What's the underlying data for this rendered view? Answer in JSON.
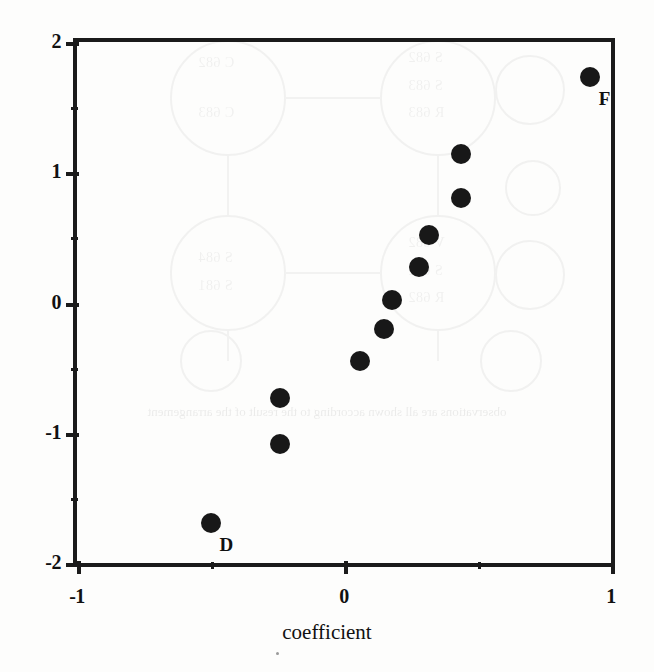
{
  "chart_data": {
    "type": "scatter",
    "title": "",
    "subtitle": "",
    "xlabel": "coefficient",
    "ylabel": "",
    "xlim": [
      -1,
      1
    ],
    "ylim": [
      -2,
      2
    ],
    "grid": false,
    "legend": "none",
    "x_ticks": [
      {
        "value": -1,
        "label": "-1",
        "kind": "major"
      },
      {
        "value": -0.5,
        "label": "",
        "kind": "minor"
      },
      {
        "value": 0,
        "label": "0",
        "kind": "major"
      },
      {
        "value": 0.5,
        "label": "",
        "kind": "minor"
      },
      {
        "value": 1,
        "label": "1",
        "kind": "major"
      }
    ],
    "y_ticks": [
      {
        "value": 2,
        "label": "2",
        "kind": "major"
      },
      {
        "value": 1.5,
        "label": "",
        "kind": "minor"
      },
      {
        "value": 1,
        "label": "1",
        "kind": "major"
      },
      {
        "value": 0.5,
        "label": "",
        "kind": "minor"
      },
      {
        "value": 0,
        "label": "0",
        "kind": "major"
      },
      {
        "value": -0.5,
        "label": "",
        "kind": "minor"
      },
      {
        "value": -1,
        "label": "-1",
        "kind": "major"
      },
      {
        "value": -1.5,
        "label": "",
        "kind": "minor"
      },
      {
        "value": -2,
        "label": "-2",
        "kind": "major"
      }
    ],
    "marker": {
      "shape": "circle",
      "color": "#181818",
      "size_px": 20
    },
    "points": [
      {
        "x": 0.92,
        "y": 1.73,
        "label": "F"
      },
      {
        "x": 0.44,
        "y": 1.14,
        "label": ""
      },
      {
        "x": 0.44,
        "y": 0.8,
        "label": ""
      },
      {
        "x": 0.32,
        "y": 0.52,
        "label": ""
      },
      {
        "x": 0.28,
        "y": 0.27,
        "label": ""
      },
      {
        "x": 0.18,
        "y": 0.02,
        "label": ""
      },
      {
        "x": 0.15,
        "y": -0.2,
        "label": ""
      },
      {
        "x": 0.06,
        "y": -0.45,
        "label": ""
      },
      {
        "x": -0.24,
        "y": -0.73,
        "label": ""
      },
      {
        "x": -0.24,
        "y": -1.09,
        "label": ""
      },
      {
        "x": -0.5,
        "y": -1.69,
        "label": "D"
      }
    ],
    "axis_color": "#1b1b1b"
  },
  "bleed": {
    "note": "faint mirrored show-through from the reverse page",
    "text_line": "observations are all shown according to the result of the arrangement",
    "node_labels": [
      "C 682",
      "C 683",
      "S 682",
      "S 683",
      "R 683",
      "S 684",
      "S 681",
      "V 682",
      "S 682",
      "R 682",
      "S 681",
      "C 681"
    ]
  }
}
